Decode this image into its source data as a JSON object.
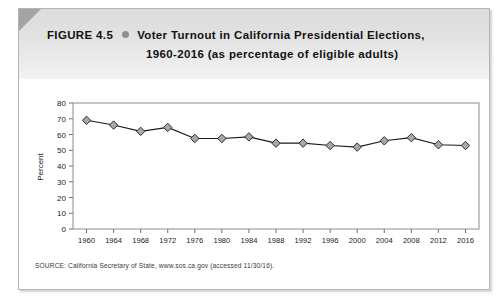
{
  "header": {
    "figure_number": "FIGURE 4.5",
    "bullet_icon": "bullet-dot",
    "title_line_1": "Voter Turnout in California Presidential Elections,",
    "title_line_2": "1960-2016 (as percentage of eligible adults)"
  },
  "source": {
    "text": "SOURCE: California Secretary of State, www.sos.ca.gov (accessed 11/30/16)."
  },
  "colors": {
    "header_band": "#e2e2e2",
    "bullet": "#8e8e8e",
    "marker_fill": "#a8a8a8",
    "marker_stroke": "#2b2b2b",
    "line": "#1a1a1a",
    "axis": "#6e6e6e",
    "page_border": "#b4b4b4"
  },
  "chart_data": {
    "type": "line",
    "title": "Voter Turnout in California Presidential Elections, 1960-2016 (as percentage of eligible adults)",
    "xlabel": "",
    "ylabel": "Percent",
    "ylim": [
      0,
      80
    ],
    "ytick_step": 10,
    "yticks": [
      0,
      10,
      20,
      30,
      40,
      50,
      60,
      70,
      80
    ],
    "categories": [
      1960,
      1964,
      1968,
      1972,
      1976,
      1980,
      1984,
      1988,
      1992,
      1996,
      2000,
      2004,
      2008,
      2012,
      2016
    ],
    "xtick_labels": [
      "1960",
      "1964",
      "1968",
      "1972",
      "1976",
      "1980",
      "1984",
      "1988",
      "1992",
      "1996",
      "2000",
      "2004",
      "2008",
      "2012",
      "2016"
    ],
    "values": [
      69,
      66,
      62,
      64.5,
      57.5,
      57.5,
      58.5,
      54.5,
      54.5,
      53,
      52,
      56,
      58,
      53.5,
      53
    ],
    "series": [
      {
        "name": "Voter turnout",
        "values": [
          69,
          66,
          62,
          64.5,
          57.5,
          57.5,
          58.5,
          54.5,
          54.5,
          53,
          52,
          56,
          58,
          53.5,
          53
        ]
      }
    ],
    "marker": "diamond",
    "grid": false,
    "legend": false,
    "legend_position": "none"
  }
}
